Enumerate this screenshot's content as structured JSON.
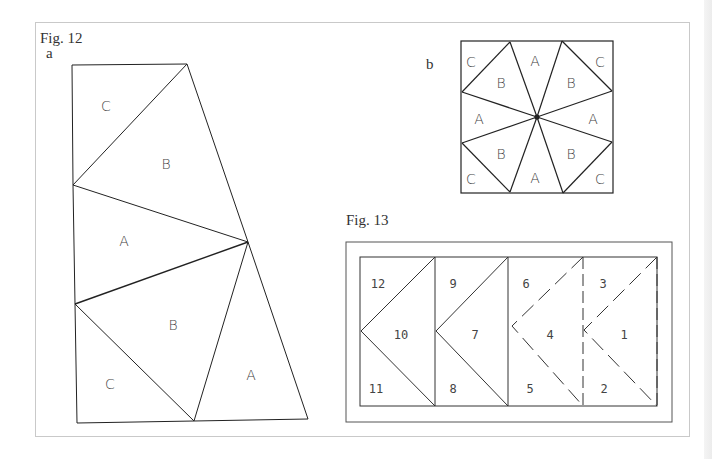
{
  "figure12": {
    "caption": "Fig. 12",
    "part_a": {
      "label": "a",
      "regions": [
        {
          "label": "C",
          "x": 106,
          "y": 111
        },
        {
          "label": "B",
          "x": 166,
          "y": 167
        },
        {
          "label": "A",
          "x": 124,
          "y": 243
        },
        {
          "label": "B",
          "x": 173,
          "y": 327
        },
        {
          "label": "C",
          "x": 110,
          "y": 386
        },
        {
          "label": "A",
          "x": 251,
          "y": 377
        }
      ]
    },
    "part_b": {
      "label": "b",
      "regions": [
        {
          "label": "C",
          "x": 471,
          "y": 62
        },
        {
          "label": "A",
          "x": 535,
          "y": 61
        },
        {
          "label": "C",
          "x": 600,
          "y": 62
        },
        {
          "label": "B",
          "x": 501,
          "y": 83
        },
        {
          "label": "B",
          "x": 571,
          "y": 83
        },
        {
          "label": "A",
          "x": 479,
          "y": 119
        },
        {
          "label": "A",
          "x": 593,
          "y": 119
        },
        {
          "label": "B",
          "x": 501,
          "y": 154
        },
        {
          "label": "B",
          "x": 571,
          "y": 154
        },
        {
          "label": "C",
          "x": 471,
          "y": 179
        },
        {
          "label": "A",
          "x": 535,
          "y": 178
        },
        {
          "label": "C",
          "x": 600,
          "y": 179
        }
      ]
    }
  },
  "figure13": {
    "caption": "Fig. 13",
    "pieces": [
      {
        "label": "12",
        "x": 378,
        "y": 284
      },
      {
        "label": "10",
        "x": 401,
        "y": 335
      },
      {
        "label": "11",
        "x": 376,
        "y": 389
      },
      {
        "label": "9",
        "x": 453,
        "y": 284
      },
      {
        "label": "7",
        "x": 475,
        "y": 335
      },
      {
        "label": "8",
        "x": 453,
        "y": 389
      },
      {
        "label": "6",
        "x": 526,
        "y": 284
      },
      {
        "label": "4",
        "x": 550,
        "y": 335
      },
      {
        "label": "5",
        "x": 530,
        "y": 389
      },
      {
        "label": "3",
        "x": 603,
        "y": 284
      },
      {
        "label": "1",
        "x": 624,
        "y": 335
      },
      {
        "label": "2",
        "x": 604,
        "y": 389
      }
    ]
  }
}
